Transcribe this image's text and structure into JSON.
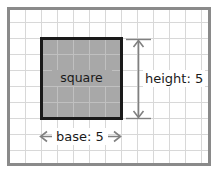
{
  "figure": {
    "type": "geometry-diagram",
    "subject": "square",
    "shape_label": "square",
    "dimension_labels": {
      "height": "height: 5",
      "base": "base: 5"
    },
    "measurements": {
      "base_value": 5,
      "height_value": 5,
      "units": "grid squares"
    },
    "grid": {
      "cell_size_px": 16,
      "columns": 12,
      "rows": 9,
      "line_color": "#d8d8d8",
      "visible": true
    },
    "frame": {
      "border_color": "#8a8a8a",
      "background_color": "#ffffff"
    },
    "shape": {
      "fill_color": "#a8a8a8",
      "stroke_color": "#1a1a1a",
      "stroke_width_px": 3,
      "cells_wide": 5,
      "cells_tall": 5
    },
    "annotation": {
      "arrow_color": "#808080",
      "text_color": "#1a1a1a"
    }
  }
}
